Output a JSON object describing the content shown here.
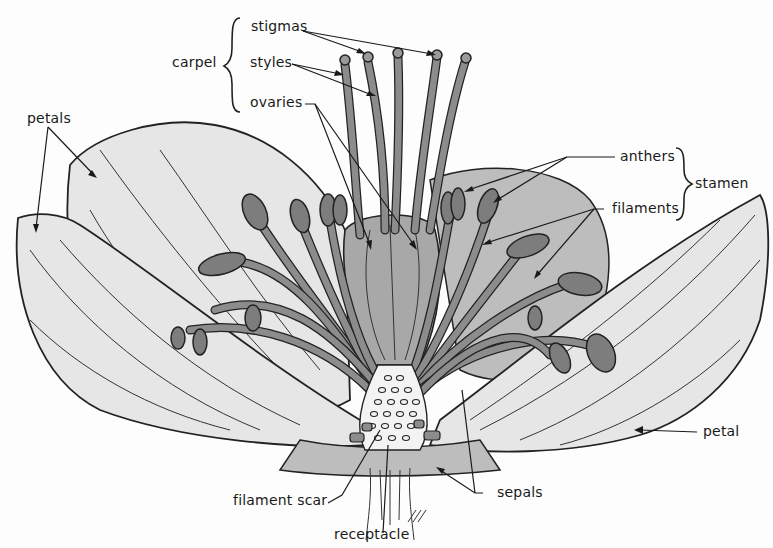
{
  "diagram": {
    "colors": {
      "background": "#fdfdfd",
      "petal_fill": "#e6e6e6",
      "sepal_fill": "#bdbdbd",
      "stamen_fill": "#8c8c8c",
      "carpel_fill": "#a8a8a8",
      "outline": "#222222"
    },
    "labels": {
      "stigmas": "stigmas",
      "styles": "styles",
      "ovaries": "ovaries",
      "carpel": "carpel",
      "petals": "petals",
      "anthers": "anthers",
      "filaments": "filaments",
      "stamen": "stamen",
      "petal": "petal",
      "filament_scar": "filament scar",
      "sepals": "sepals",
      "receptacle": "receptacle"
    },
    "groups": {
      "carpel": [
        "stigmas",
        "styles",
        "ovaries"
      ],
      "stamen": [
        "anthers",
        "filaments"
      ]
    }
  }
}
